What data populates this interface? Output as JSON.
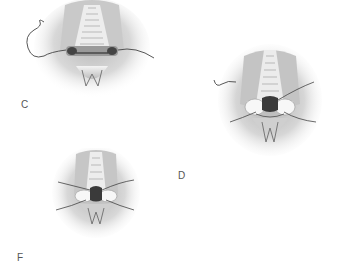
{
  "figure": {
    "panels": [
      {
        "id": "C",
        "label": "C",
        "description": "Surgical closure with running suture across lower edge, needle curling upper-left"
      },
      {
        "id": "D",
        "label": "D",
        "description": "Closure with two lateral pledgets and crossing sutures"
      },
      {
        "id": "F",
        "label": "F",
        "description": "Completed closure with pledgets and four suture tails"
      }
    ],
    "colors": {
      "background": "#ffffff",
      "tissue_dark": "#8a8a8a",
      "tissue_light": "#e6e6e6",
      "suture": "#444444",
      "label": "#555555"
    }
  }
}
